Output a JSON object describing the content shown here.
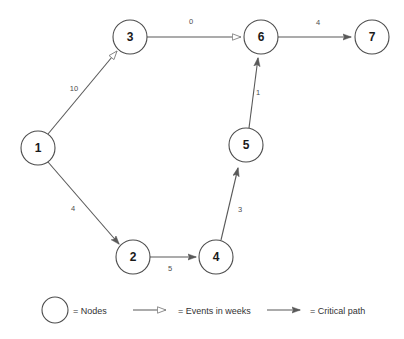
{
  "diagram": {
    "colors": {
      "node_stroke": "#4d4d4d",
      "edge_stroke": "#595959",
      "label_text": "#4d4d4d",
      "node_text": "#1a1a1a",
      "background": "#ffffff"
    },
    "nodes": [
      {
        "id": "1",
        "label": "1",
        "cx": 38,
        "cy": 148,
        "r": 17
      },
      {
        "id": "2",
        "label": "2",
        "cx": 133,
        "cy": 257,
        "r": 17
      },
      {
        "id": "3",
        "label": "3",
        "cx": 130,
        "cy": 37,
        "r": 17
      },
      {
        "id": "4",
        "label": "4",
        "cx": 216,
        "cy": 257,
        "r": 17
      },
      {
        "id": "5",
        "label": "5",
        "cx": 246,
        "cy": 145,
        "r": 17
      },
      {
        "id": "6",
        "label": "6",
        "cx": 261,
        "cy": 37,
        "r": 17
      },
      {
        "id": "7",
        "label": "7",
        "cx": 372,
        "cy": 37,
        "r": 17
      }
    ],
    "edges": [
      {
        "from": "1",
        "to": "3",
        "label": "10",
        "arrow": "hollow",
        "label_x": 74,
        "label_y": 88
      },
      {
        "from": "3",
        "to": "6",
        "label": "0",
        "arrow": "hollow",
        "label_x": 191,
        "label_y": 21
      },
      {
        "from": "6",
        "to": "7",
        "label": "4",
        "arrow": "filled",
        "label_x": 318,
        "label_y": 22
      },
      {
        "from": "1",
        "to": "2",
        "label": "4",
        "arrow": "filled",
        "label_x": 73,
        "label_y": 208
      },
      {
        "from": "2",
        "to": "4",
        "label": "5",
        "arrow": "filled",
        "label_x": 170,
        "label_y": 268
      },
      {
        "from": "4",
        "to": "5",
        "label": "3",
        "arrow": "filled",
        "label_x": 240,
        "label_y": 209
      },
      {
        "from": "5",
        "to": "6",
        "label": "1",
        "arrow": "filled",
        "label_x": 258,
        "label_y": 92
      }
    ]
  },
  "legend": {
    "items": [
      {
        "key": "nodes",
        "symbol": "circle",
        "text": "= Nodes"
      },
      {
        "key": "events",
        "symbol": "hollow-arrow",
        "text": "= Events in weeks"
      },
      {
        "key": "critical-path",
        "symbol": "filled-arrow",
        "text": "= Critical path"
      }
    ]
  }
}
